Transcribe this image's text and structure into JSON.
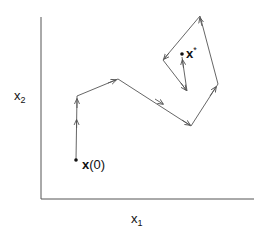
{
  "diagram": {
    "title": "",
    "axes": {
      "x_label": "x",
      "x_subscript": "1",
      "y_label": "x",
      "y_subscript": "2"
    },
    "start_point": {
      "label_bold": "x",
      "label_rest": "(0)"
    },
    "optimum_point": {
      "label_bold": "x",
      "label_sup": "*"
    },
    "path_vertices": [
      [
        76,
        160
      ],
      [
        77,
        96
      ],
      [
        118,
        79
      ],
      [
        191,
        126
      ],
      [
        218,
        84
      ],
      [
        200,
        16
      ],
      [
        163,
        60
      ],
      [
        187,
        91
      ],
      [
        182,
        55
      ]
    ],
    "colors": {
      "line": "#555555",
      "text": "#111111",
      "background": "#ffffff"
    }
  }
}
